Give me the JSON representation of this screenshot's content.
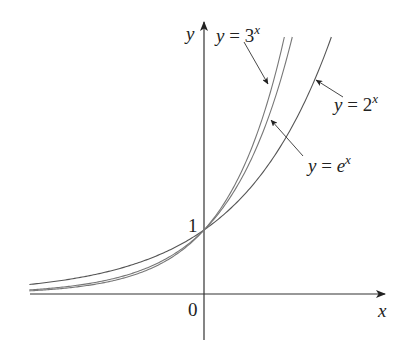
{
  "chart_data": {
    "type": "line",
    "title": "",
    "xlabel": "x",
    "ylabel": "y",
    "xlim": [
      -2.75,
      2.6
    ],
    "ylim": [
      0,
      4.0
    ],
    "grid": false,
    "legend_position": "inline annotations with pointer arrows",
    "tick_labels": {
      "origin": "0",
      "y_intercept": "1"
    },
    "series": [
      {
        "name": "y = 2^x",
        "base": 2,
        "color": "#555555",
        "x": [
          -2.75,
          -2,
          -1,
          0,
          1,
          2
        ],
        "y": [
          0.149,
          0.25,
          0.5,
          1,
          2,
          4
        ]
      },
      {
        "name": "y = e^x",
        "base": 2.71828,
        "color": "#777777",
        "x": [
          -2.75,
          -2,
          -1,
          0,
          1,
          1.39
        ],
        "y": [
          0.064,
          0.135,
          0.368,
          1,
          2.718,
          4.0
        ]
      },
      {
        "name": "y = 3^x",
        "base": 3,
        "color": "#777777",
        "x": [
          -2.75,
          -2,
          -1,
          0,
          1,
          1.26
        ],
        "y": [
          0.049,
          0.111,
          0.333,
          1,
          3,
          4.0
        ]
      }
    ],
    "annotations": [
      {
        "text": "y = 3^x",
        "points_to": "y = 3^x"
      },
      {
        "text": "y = 2^x",
        "points_to": "y = 2^x"
      },
      {
        "text": "y = e^x",
        "points_to": "y = e^x"
      }
    ]
  },
  "labels": {
    "y_axis": "y",
    "x_axis": "x",
    "origin": "0",
    "one": "1",
    "three": {
      "lhs": "y",
      "eq": " = 3",
      "exp": "x"
    },
    "two": {
      "lhs": "y",
      "eq": " = 2",
      "exp": "x"
    },
    "e": {
      "lhs": "y",
      "eq": " = ",
      "base": "e",
      "exp": "x"
    }
  },
  "layout": {
    "origin_px": [
      204,
      294
    ],
    "px_per_unit_x": 63.5,
    "px_per_unit_y": 64,
    "top_px": 37
  }
}
